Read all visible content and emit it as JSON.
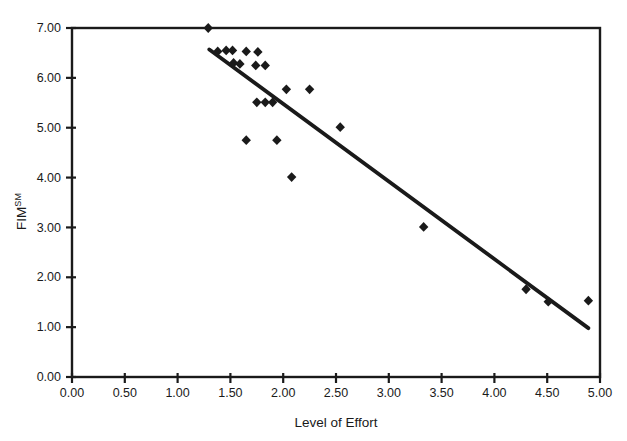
{
  "chart_data": {
    "type": "scatter",
    "title": "",
    "xlabel": "Level of Effort",
    "ylabel": "FIM",
    "ylabel_superscript": "SM",
    "xlim": [
      0,
      5
    ],
    "ylim": [
      0,
      7
    ],
    "grid": false,
    "legend": "none",
    "marker": "diamond",
    "x_tick_labels": [
      "0.00",
      "0.50",
      "1.00",
      "1.50",
      "2.00",
      "2.50",
      "3.00",
      "3.50",
      "4.00",
      "4.50",
      "5.00"
    ],
    "y_tick_labels": [
      "0.00",
      "1.00",
      "2.00",
      "3.00",
      "4.00",
      "5.00",
      "6.00",
      "7.00"
    ],
    "points": [
      [
        1.29,
        7.0
      ],
      [
        1.38,
        6.53
      ],
      [
        1.46,
        6.55
      ],
      [
        1.52,
        6.55
      ],
      [
        1.65,
        6.53
      ],
      [
        1.76,
        6.52
      ],
      [
        1.53,
        6.3
      ],
      [
        1.59,
        6.28
      ],
      [
        1.74,
        6.25
      ],
      [
        1.83,
        6.25
      ],
      [
        2.03,
        5.77
      ],
      [
        2.25,
        5.77
      ],
      [
        1.75,
        5.51
      ],
      [
        1.83,
        5.51
      ],
      [
        1.9,
        5.51
      ],
      [
        2.54,
        5.01
      ],
      [
        1.65,
        4.75
      ],
      [
        1.94,
        4.75
      ],
      [
        2.08,
        4.01
      ],
      [
        3.33,
        3.01
      ],
      [
        4.3,
        1.76
      ],
      [
        4.51,
        1.51
      ],
      [
        4.89,
        1.53
      ]
    ],
    "trendline": {
      "x1": 1.3,
      "y1": 6.57,
      "x2": 4.89,
      "y2": 0.98
    },
    "colors": {
      "ink": "#1a1a1a",
      "background": "#ffffff"
    }
  }
}
